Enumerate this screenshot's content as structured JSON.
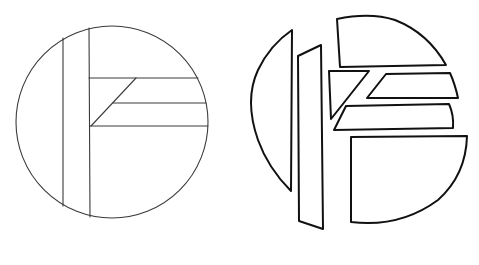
{
  "figure": {
    "width": 479,
    "height": 265,
    "background": "#ffffff"
  },
  "colors": {
    "line_thin": "#3a3a3a",
    "line_thick": "#111111",
    "fill": "#ffffff"
  },
  "assembled_circle": {
    "center": [
      112,
      122
    ],
    "radius": 96,
    "vertical_lines_x": [
      63,
      89
    ],
    "horizontal_lines_y": [
      78,
      103,
      126
    ],
    "diagonal": {
      "from": [
        136,
        78
      ],
      "to": [
        91,
        126
      ]
    }
  },
  "separated_pieces": [
    {
      "id": "left-segment",
      "shape": "circular segment"
    },
    {
      "id": "vertical-strip",
      "shape": "narrow strip"
    },
    {
      "id": "top-segment",
      "shape": "circular segment"
    },
    {
      "id": "triangle",
      "shape": "triangle"
    },
    {
      "id": "upper-band",
      "shape": "trapezoid band"
    },
    {
      "id": "lower-band",
      "shape": "trapezoid band"
    },
    {
      "id": "bottom-segment",
      "shape": "circular segment"
    }
  ]
}
